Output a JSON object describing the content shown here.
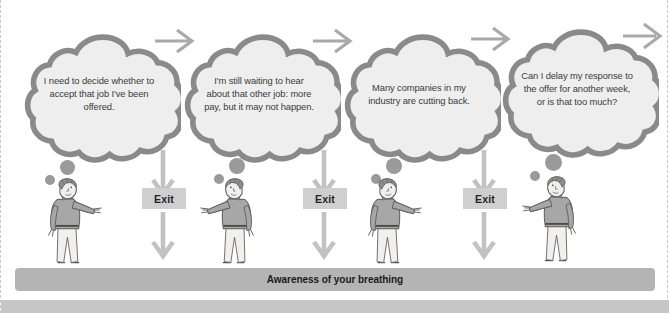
{
  "figure": {
    "top_cut_text": " ",
    "bottom_bar_label": "Awareness of your breathing",
    "colors": {
      "cloud_fill": "#eeeeee",
      "cloud_stroke": "#8a8a8a",
      "arrow": "#b9b9b9",
      "arrow_horizontal": "#a9a9a9",
      "exit_box": "#cfcfcf",
      "breath_bar": "#b4b4b4",
      "foot_bar": "#c6c6c6",
      "dot": "#9a9a9a",
      "border_dashed": "#c9c9c9"
    }
  },
  "columns": [
    {
      "id": "column-1",
      "thought": "I need to decide whether to accept that job I've been offered.",
      "thought_lines": [
        "I need to decide",
        "whether to accept",
        "that job I've been",
        "offered."
      ],
      "figure_name": "person-pointing-right",
      "has_exit": false,
      "exit_label": null
    },
    {
      "id": "column-2",
      "thought": "I'm still waiting to hear about that other job: more pay, but it may not happen.",
      "thought_lines": [
        "I'm still waiting to hear",
        "about that other job:",
        "more pay, but it may",
        "not happen."
      ],
      "figure_name": "person-pointing-left",
      "has_exit": true,
      "exit_label": "Exit"
    },
    {
      "id": "column-3",
      "thought": "Many companies in my industry are cutting back.",
      "thought_lines": [
        "Many companies",
        "in my industry are",
        "cutting back."
      ],
      "figure_name": "person-pointing-right",
      "has_exit": true,
      "exit_label": "Exit"
    },
    {
      "id": "column-4",
      "thought": "Can I delay my response to the offer for another week, or is that too much?",
      "thought_lines": [
        "Can I delay my",
        "response to the offer",
        "for another week, or is",
        "that too much?"
      ],
      "figure_name": "person-pointing-left",
      "has_exit": true,
      "exit_label": "Exit"
    }
  ],
  "exits": [
    {
      "label": "Exit"
    },
    {
      "label": "Exit"
    },
    {
      "label": "Exit"
    }
  ]
}
